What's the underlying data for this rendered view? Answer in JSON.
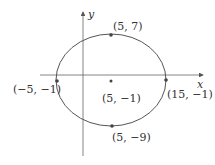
{
  "diagram": {
    "type": "ellipse-on-axes",
    "axes": {
      "x_label": "x",
      "y_label": "y"
    },
    "center": {
      "label": "(5, −1)"
    },
    "points": {
      "top": {
        "label": "(5, 7)"
      },
      "bottom": {
        "label": "(5, −9)"
      },
      "left": {
        "label": "(−5, −1)"
      },
      "right": {
        "label": "(15, −1)"
      }
    },
    "colors": {
      "stroke": "#555555",
      "point": "#444444",
      "text": "#333333"
    }
  }
}
